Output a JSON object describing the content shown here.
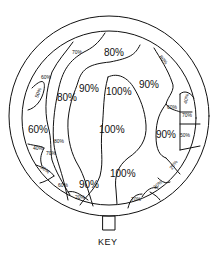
{
  "diagram": {
    "type": "contour-map",
    "outer_ring": "circle",
    "key_label": "KEY",
    "labels_large": [
      {
        "text": "80%",
        "x": 117,
        "y": 52
      },
      {
        "text": "90%",
        "x": 92,
        "y": 90
      },
      {
        "text": "100%",
        "x": 120,
        "y": 93
      },
      {
        "text": "90%",
        "x": 150,
        "y": 86
      },
      {
        "text": "80%",
        "x": 66,
        "y": 100
      },
      {
        "text": "60%",
        "x": 38,
        "y": 134
      },
      {
        "text": "100%",
        "x": 112,
        "y": 134
      },
      {
        "text": "90%",
        "x": 167,
        "y": 137
      },
      {
        "text": "100%",
        "x": 122,
        "y": 176
      },
      {
        "text": "90%",
        "x": 89,
        "y": 186
      }
    ],
    "labels_small": [
      {
        "text": "70%",
        "x": 80,
        "y": 52,
        "rot": 0
      },
      {
        "text": "60%",
        "x": 47,
        "y": 77,
        "rot": 0
      },
      {
        "text": "50%",
        "x": 36,
        "y": 93,
        "rot": -70
      },
      {
        "text": "80%",
        "x": 164,
        "y": 60,
        "rot": 50
      },
      {
        "text": "40%",
        "x": 186,
        "y": 99,
        "rot": -80
      },
      {
        "text": "60%",
        "x": 172,
        "y": 107,
        "rot": 0
      },
      {
        "text": "70%",
        "x": 183,
        "y": 116,
        "rot": 0
      },
      {
        "text": "50%",
        "x": 182,
        "y": 137,
        "rot": 0
      },
      {
        "text": "20%",
        "x": 175,
        "y": 166,
        "rot": -55
      },
      {
        "text": "30%",
        "x": 162,
        "y": 186,
        "rot": -40
      },
      {
        "text": "70%",
        "x": 136,
        "y": 201,
        "rot": 0
      },
      {
        "text": "80%",
        "x": 60,
        "y": 143,
        "rot": 0
      },
      {
        "text": "40%",
        "x": 37,
        "y": 151,
        "rot": 0
      },
      {
        "text": "70%",
        "x": 50,
        "y": 155,
        "rot": 0
      },
      {
        "text": "30%",
        "x": 44,
        "y": 172,
        "rot": 35
      },
      {
        "text": "60%",
        "x": 61,
        "y": 186,
        "rot": 0
      },
      {
        "text": "20%",
        "x": 80,
        "y": 199,
        "rot": 0
      }
    ]
  }
}
